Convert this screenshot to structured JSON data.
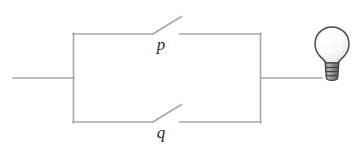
{
  "figure": {
    "name": "parallel-switch-circuit",
    "background_color": "#ffffff",
    "line_color": "#a8a8a8",
    "line_width": 1.6,
    "label_color": "#2b2b2b"
  },
  "labels": {
    "switch_p": "p",
    "switch_q": "q"
  },
  "components": {
    "switch_p": {
      "icon": "open-switch-icon",
      "state": "open",
      "branch": "top"
    },
    "switch_q": {
      "icon": "open-switch-icon",
      "state": "open",
      "branch": "bottom"
    },
    "lamp": {
      "icon": "light-bulb-icon",
      "state": "off",
      "glass_color": "#fbfbfb",
      "glass_outline": "#4a4a4a",
      "base_color": "#8a8a8a",
      "base_outline": "#3d3d3d"
    }
  },
  "geometry": {
    "left_lead": {
      "x1": 13,
      "y1": 78,
      "x2": 73,
      "y2": 78
    },
    "right_lead": {
      "x1": 261,
      "y1": 78,
      "x2": 321,
      "y2": 78
    },
    "rect": {
      "left": 73,
      "right": 261,
      "top": 34,
      "bottom": 122
    },
    "top_branch": {
      "wire_left": {
        "x1": 73,
        "y1": 34,
        "x2": 152,
        "y2": 34
      },
      "arm": {
        "x1": 152,
        "y1": 34,
        "x2": 181,
        "y2": 17
      },
      "wire_right": {
        "x1": 180,
        "y1": 34,
        "x2": 261,
        "y2": 34
      },
      "label_pos": {
        "x": 161,
        "y": 50
      }
    },
    "bottom_branch": {
      "wire_left": {
        "x1": 73,
        "y1": 122,
        "x2": 152,
        "y2": 122
      },
      "arm": {
        "x1": 152,
        "y1": 122,
        "x2": 181,
        "y2": 105
      },
      "wire_right": {
        "x1": 180,
        "y1": 122,
        "x2": 261,
        "y2": 122
      },
      "label_pos": {
        "x": 161,
        "y": 138
      }
    },
    "bulb": {
      "cx": 332,
      "cy": 45,
      "r": 17,
      "base_top": 62,
      "base_bottom": 80
    }
  }
}
